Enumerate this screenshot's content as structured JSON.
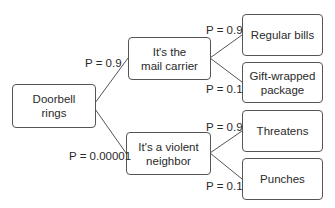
{
  "diagram": {
    "type": "probability-tree",
    "root": {
      "label": "Doorbell\nrings"
    },
    "branches": [
      {
        "label": "It's the\nmail carrier",
        "probability": "P = 0.9",
        "outcomes": [
          {
            "label": "Regular bills",
            "probability": "P = 0.9"
          },
          {
            "label": "Gift-wrapped\npackage",
            "probability": "P = 0.1"
          }
        ]
      },
      {
        "label": "It's a violent\nneighbor",
        "probability": "P = 0.00001",
        "outcomes": [
          {
            "label": "Threatens",
            "probability": "P = 0.9"
          },
          {
            "label": "Punches",
            "probability": "P = 0.1"
          }
        ]
      }
    ],
    "colors": {
      "line": "#555555",
      "text": "#2a2a2a",
      "background": "#ffffff"
    }
  }
}
